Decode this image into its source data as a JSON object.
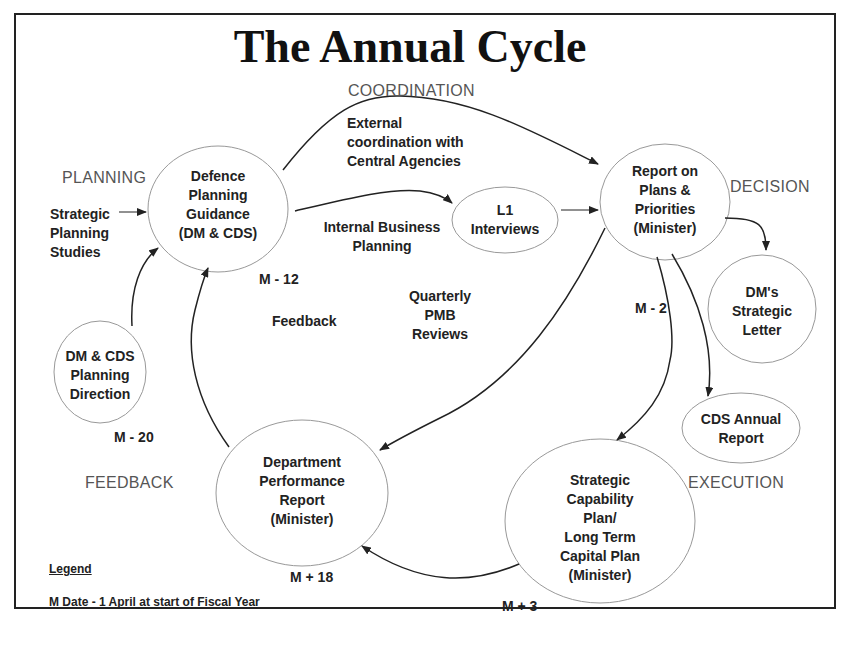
{
  "title": "The Annual Cycle",
  "phases": {
    "coordination": "COORDINATION",
    "planning": "PLANNING",
    "decision": "DECISION",
    "feedback": "FEEDBACK",
    "execution": "EXECUTION"
  },
  "nodes": {
    "defence_planning_guidance": "Defence\nPlanning\nGuidance\n(DM & CDS)",
    "l1_interviews": "L1\nInterviews",
    "report_on_plans": "Report on\nPlans &\nPriorities\n(Minister)",
    "dm_strategic_letter": "DM's\nStrategic\nLetter",
    "cds_annual_report": "CDS Annual\nReport",
    "strategic_capability_plan": "Strategic\nCapability\nPlan/\nLong Term\nCapital Plan\n(Minister)",
    "department_performance_report": "Department\nPerformance\nReport\n(Minister)",
    "dm_cds_planning_direction": "DM & CDS\nPlanning\nDirection"
  },
  "labels": {
    "external_coordination": "External\ncoordination with\nCentral Agencies",
    "internal_business_planning": "Internal Business\nPlanning",
    "strategic_planning_studies": "Strategic\nPlanning\nStudies",
    "quarterly_pmb_reviews": "Quarterly\nPMB\nReviews",
    "feedback": "Feedback",
    "m_minus_12": "M - 12",
    "m_minus_20": "M - 20",
    "m_minus_2": "M - 2",
    "m_plus_18": "M + 18",
    "m_plus_3": "M + 3"
  },
  "legend": {
    "title": "Legend",
    "text": "M Date - 1 April at start of Fiscal Year"
  },
  "colors": {
    "border": "#222222",
    "ellipse_stroke": "#999999",
    "arrow": "#222222",
    "phase_text": "#555555"
  }
}
